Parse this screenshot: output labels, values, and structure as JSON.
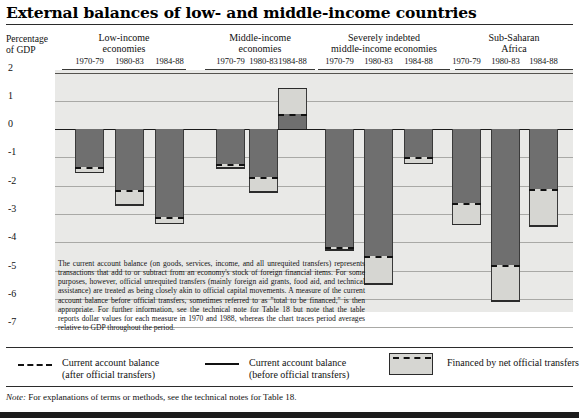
{
  "title": "External balances of low- and middle-income countries",
  "axis": {
    "ylabel_line1": "Percentage",
    "ylabel_line2": "of GDP",
    "yticks": [
      "2",
      "1",
      "0",
      "-1",
      "-2",
      "-3",
      "-4",
      "-5",
      "-6",
      "-7"
    ]
  },
  "groups": [
    {
      "name_line1": "Low-income",
      "name_line2": "economies"
    },
    {
      "name_line1": "Middle-income",
      "name_line2": "economies"
    },
    {
      "name_line1": "Severely indebted",
      "name_line2": "middle-income economies"
    },
    {
      "name_line1": "Sub-Saharan",
      "name_line2": "Africa"
    }
  ],
  "periods": [
    "1970-79",
    "1980-83",
    "1984-88"
  ],
  "blurb": "The current account balance (on goods, services, income, and all unrequited transfers) represents transactions that add to or subtract from an economy's stock of foreign financial items. For some purposes, however, official unrequited transfers (mainly foreign aid grants, food aid, and technical assistance) are treated as being closely akin to official capital movements. A measure of the current account balance before official transfers, sometimes referred to as \"total to be financed,\" is then appropriate. For further information, see the technical note for Table 18 but note that the table reports dollar values for each measure in 1970 and 1988, whereas the chart traces period averages relative to GDP throughout the period.",
  "legend": [
    {
      "icon": "dashed-line",
      "label_line1": "Current account balance",
      "label_line2": "(after official transfers)"
    },
    {
      "icon": "solid-line",
      "label_line1": "Current account balance",
      "label_line2": "(before official transfers)"
    },
    {
      "icon": "shaded-box",
      "label_line1": "Financed by net official transfers",
      "label_line2": ""
    }
  ],
  "note_label": "Note:",
  "note_text": "For explanations of terms or methods, see the technical notes for Table 18.",
  "colors": {
    "before_transfers_fill": "#6f6f6f",
    "official_transfers_fill": "#d6d6d2",
    "panel_background": "#e9e9e7",
    "outline": "#2b2b2b"
  },
  "chart_data": {
    "type": "bar",
    "title": "External balances of low- and middle-income countries",
    "xlabel": "",
    "ylabel": "Percentage of GDP",
    "ylim": [
      -7,
      2
    ],
    "grid": true,
    "legend_position": "bottom",
    "categories": [
      "Low-income economies 1970-79",
      "Low-income economies 1980-83",
      "Low-income economies 1984-88",
      "Middle-income economies 1970-79",
      "Middle-income economies 1980-83",
      "Middle-income economies 1984-88",
      "Severely indebted middle-income economies 1970-79",
      "Severely indebted middle-income economies 1980-83",
      "Severely indebted middle-income economies 1984-88",
      "Sub-Saharan Africa 1970-79",
      "Sub-Saharan Africa 1980-83",
      "Sub-Saharan Africa 1984-88"
    ],
    "series": [
      {
        "name": "Current account balance (before official transfers)",
        "values": [
          -1.55,
          -2.7,
          -3.35,
          -1.4,
          -2.25,
          1.45,
          -4.3,
          -5.5,
          -1.25,
          -3.4,
          -6.1,
          -3.45
        ]
      },
      {
        "name": "Current account balance (after official transfers)",
        "values": [
          -1.35,
          -2.15,
          -3.1,
          -1.25,
          -1.7,
          0.55,
          -4.15,
          -4.5,
          -1.0,
          -2.6,
          -4.8,
          -2.1
        ]
      }
    ],
    "bars": [
      {
        "group": "Low-income economies",
        "period": "1970-79",
        "before": -1.55,
        "after": -1.35
      },
      {
        "group": "Low-income economies",
        "period": "1980-83",
        "before": -2.7,
        "after": -2.15
      },
      {
        "group": "Low-income economies",
        "period": "1984-88",
        "before": -3.35,
        "after": -3.1
      },
      {
        "group": "Middle-income economies",
        "period": "1970-79",
        "before": -1.4,
        "after": -1.25
      },
      {
        "group": "Middle-income economies",
        "period": "1980-83",
        "before": -2.25,
        "after": -1.7
      },
      {
        "group": "Middle-income economies",
        "period": "1984-88",
        "before": 1.45,
        "after": 0.55
      },
      {
        "group": "Severely indebted middle-income economies",
        "period": "1970-79",
        "before": -4.3,
        "after": -4.15
      },
      {
        "group": "Severely indebted middle-income economies",
        "period": "1980-83",
        "before": -5.5,
        "after": -4.5
      },
      {
        "group": "Severely indebted middle-income economies",
        "period": "1984-88",
        "before": -1.25,
        "after": -1.0
      },
      {
        "group": "Sub-Saharan Africa",
        "period": "1970-79",
        "before": -3.4,
        "after": -2.6
      },
      {
        "group": "Sub-Saharan Africa",
        "period": "1980-83",
        "before": -6.1,
        "after": -4.8
      },
      {
        "group": "Sub-Saharan Africa",
        "period": "1984-88",
        "before": -3.45,
        "after": -2.1
      }
    ]
  }
}
